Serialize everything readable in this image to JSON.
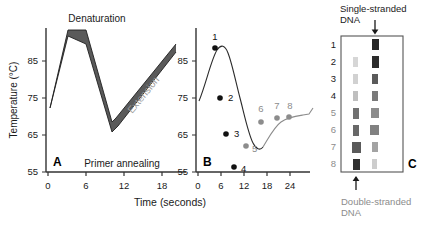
{
  "figure": {
    "panels": [
      "A",
      "B",
      "C"
    ],
    "shared_xlabel": "Time (seconds)"
  },
  "panelA": {
    "letter": "A",
    "ylabel": "Temperature (°C)",
    "xlabel": "Time (seconds)",
    "yticks": [
      "55",
      "65",
      "75",
      "85"
    ],
    "xticks": [
      "0",
      "6",
      "12",
      "18"
    ],
    "annotations": {
      "denaturation": "Denaturation",
      "primer_annealing": "Primer annealing",
      "extension": "Extension"
    },
    "band_color": "#4d4d4d",
    "line_color": "#222222"
  },
  "panelB": {
    "letter": "B",
    "yticks": [
      "55",
      "65",
      "75",
      "85"
    ],
    "xticks": [
      "0",
      "6",
      "12",
      "18",
      "24"
    ],
    "point_labels": [
      "1",
      "2",
      "3",
      "4",
      "5",
      "6",
      "7",
      "8"
    ],
    "dark_color": "#111111",
    "gray_color": "#8c8c8c"
  },
  "panelC": {
    "letter": "C",
    "top_caption": "Single-stranded DNA",
    "bottom_caption": "Double-stranded DNA",
    "lane_labels": [
      "1",
      "2",
      "3",
      "4",
      "5",
      "6",
      "7",
      "8"
    ],
    "top_arrow": "down-arrow",
    "bottom_arrow": "up-arrow",
    "dark_color": "#1a1a1a",
    "gray_color": "#8c8c8c"
  },
  "chart_data": [
    {
      "type": "line",
      "panel": "A",
      "title": "PCR thermal cycling profile",
      "xlabel": "Time (seconds)",
      "ylabel": "Temperature (°C)",
      "xlim": [
        0,
        21
      ],
      "ylim": [
        55,
        92
      ],
      "xticks": [
        0,
        6,
        12,
        18
      ],
      "yticks": [
        55,
        65,
        75,
        85
      ],
      "grid": false,
      "series": [
        {
          "name": "Thermal profile (upper bound)",
          "x": [
            1.2,
            3.6,
            10.2,
            10.8,
            19.6
          ],
          "y": [
            79.0,
            90.5,
            63.5,
            62.5,
            84.5
          ]
        },
        {
          "name": "Thermal profile (lower bound)",
          "x": [
            1.2,
            3.6,
            10.2,
            10.8,
            19.6
          ],
          "y": [
            78.0,
            87.5,
            60.0,
            59.0,
            83.0
          ]
        }
      ],
      "annotations": [
        {
          "text": "Denaturation",
          "x": 3.6,
          "y": 92
        },
        {
          "text": "Primer annealing",
          "x": 10.5,
          "y": 57
        },
        {
          "text": "Extension",
          "x": 15.0,
          "y": 74
        }
      ]
    },
    {
      "type": "scatter",
      "panel": "B",
      "xlabel": "Time (seconds)",
      "ylabel": "Temperature (°C)",
      "xlim": [
        0,
        26
      ],
      "ylim": [
        55,
        92
      ],
      "xticks": [
        0,
        6,
        12,
        18,
        24
      ],
      "yticks": [
        55,
        65,
        75,
        85
      ],
      "grid": false,
      "points": [
        {
          "label": "1",
          "x": 5.0,
          "y": 88.0,
          "color": "dark"
        },
        {
          "label": "2",
          "x": 6.3,
          "y": 75.0,
          "color": "dark"
        },
        {
          "label": "3",
          "x": 7.8,
          "y": 65.2,
          "color": "dark"
        },
        {
          "label": "4",
          "x": 9.8,
          "y": 56.2,
          "color": "dark"
        },
        {
          "label": "5",
          "x": 13.0,
          "y": 62.0,
          "color": "gray"
        },
        {
          "label": "6",
          "x": 16.8,
          "y": 68.6,
          "color": "gray"
        },
        {
          "label": "7",
          "x": 20.8,
          "y": 69.6,
          "color": "gray"
        },
        {
          "label": "8",
          "x": 23.9,
          "y": 69.8,
          "color": "gray"
        }
      ]
    },
    {
      "type": "heatmap",
      "panel": "C",
      "description": "Gel electrophoresis: left lane double-stranded DNA, right lane single-stranded DNA",
      "rows": [
        "1",
        "2",
        "3",
        "4",
        "5",
        "6",
        "7",
        "8"
      ],
      "columns": [
        "Double-stranded DNA",
        "Single-stranded DNA"
      ],
      "values": [
        [
          0.0,
          0.95
        ],
        [
          0.18,
          0.92
        ],
        [
          0.2,
          0.72
        ],
        [
          0.28,
          0.58
        ],
        [
          0.62,
          0.5
        ],
        [
          0.66,
          0.55
        ],
        [
          0.72,
          0.4
        ],
        [
          0.9,
          0.22
        ]
      ]
    }
  ]
}
